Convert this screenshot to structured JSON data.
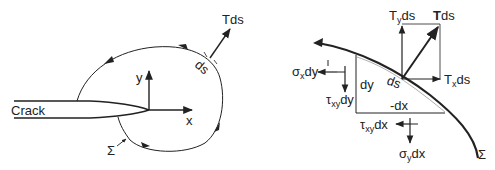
{
  "left_diagram": {
    "crack_label": "Crack",
    "x_axis_label": "x",
    "y_axis_label": "y",
    "traction_label": "Tds",
    "element_label": "ds",
    "contour_label": "Σ"
  },
  "right_diagram": {
    "traction_label_T": "T",
    "traction_label_ds": "ds",
    "ty_label_T": "T",
    "ty_label_sub": "y",
    "ty_label_ds": "ds",
    "tx_label_T": "T",
    "tx_label_sub": "x",
    "tx_label_ds": "ds",
    "sigma_x_label_sym": "σ",
    "sigma_x_label_sub": "x",
    "sigma_x_label_rest": "dy",
    "tau_xy_dy_sym": "τ",
    "tau_xy_dy_sub": "xy",
    "tau_xy_dy_rest": "dy",
    "tau_xy_dx_sym": "τ",
    "tau_xy_dx_sub": "xy",
    "tau_xy_dx_rest": "dx",
    "sigma_y_label_sym": "σ",
    "sigma_y_label_sub": "y",
    "sigma_y_label_rest": "dx",
    "dy_label": "dy",
    "dx_label": "-dx",
    "ds_label": "ds",
    "contour_label": "Σ"
  },
  "colors": {
    "ink": "#222222",
    "background": "#ffffff"
  }
}
